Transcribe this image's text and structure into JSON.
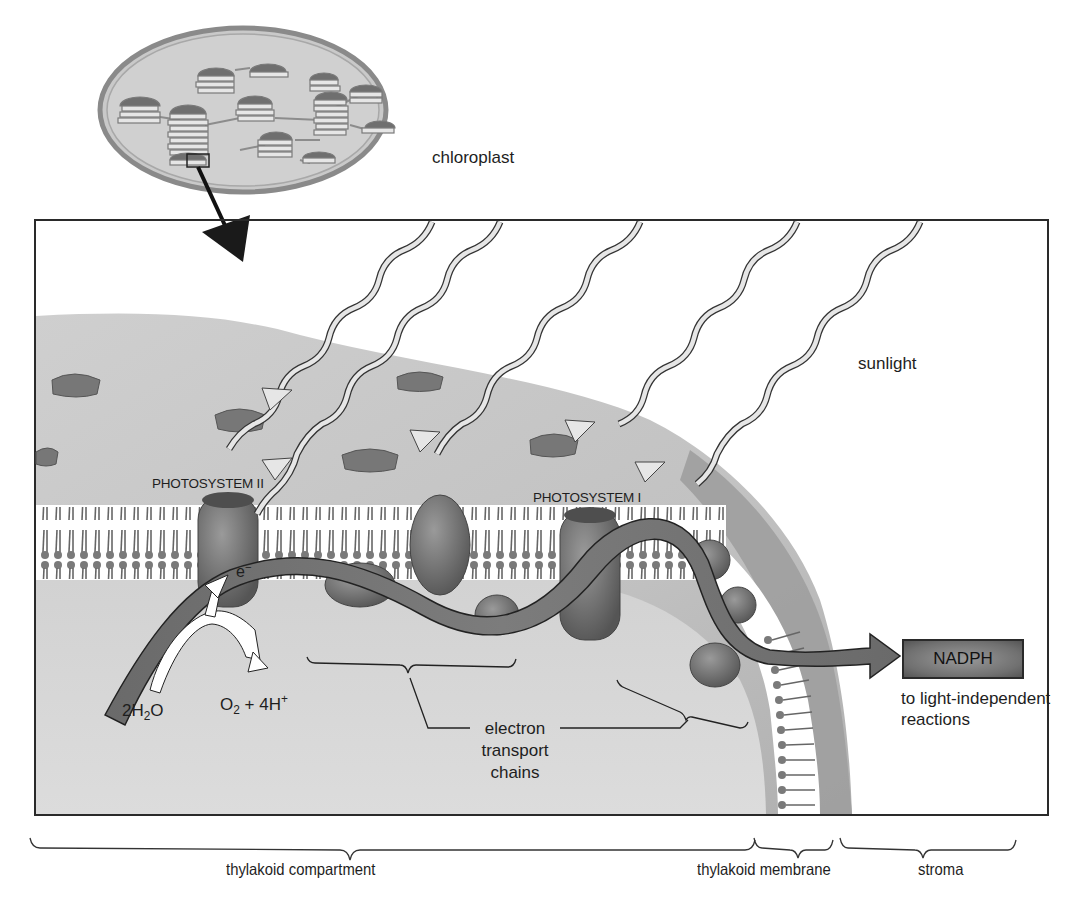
{
  "figure": {
    "inset_label": "chloroplast",
    "light_label": "sunlight",
    "photosystem_2_label": "PHOTOSYSTEM II",
    "photosystem_1_label": "PHOTOSYSTEM I",
    "electron_label": "e",
    "electron_charge": "−",
    "water_label": {
      "coef": "2H",
      "sub": "2",
      "tail": "O"
    },
    "products_label": {
      "o": "O",
      "sub": "2",
      "mid": " + 4H",
      "sup": "+"
    },
    "etc_label_line1": "electron",
    "etc_label_line2": "transport",
    "etc_label_line3": "chains",
    "nadph_label": "NADPH",
    "nadph_caption_line1": "to light-independent",
    "nadph_caption_line2": "reactions",
    "regions": [
      {
        "label": "thylakoid compartment"
      },
      {
        "label": "thylakoid membrane"
      },
      {
        "label": "stroma"
      }
    ]
  },
  "colors": {
    "background": "#ffffff",
    "thylakoid_fill": "#c8c8c8",
    "stroma_band": "#9c9c9c",
    "protein": "#6e6e6e",
    "electron_path": "#5e5e5e",
    "light_ray": "#e4e4e4",
    "outline": "#1e1e1e"
  }
}
